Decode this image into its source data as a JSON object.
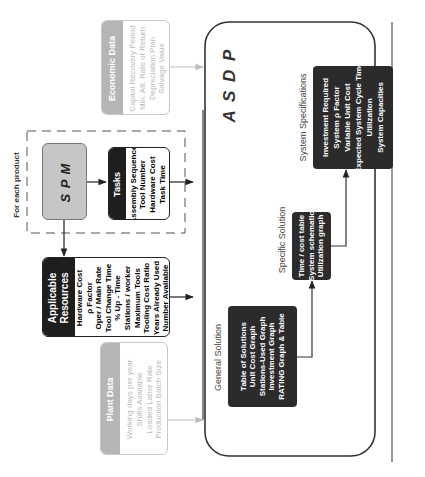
{
  "diagram": {
    "colors": {
      "dark_box": "#2b2b2b",
      "gray_header": "#b5b5b5",
      "spm_fill": "#c6c6c6",
      "line": "#333333",
      "faded_line": "#bdbdbd"
    },
    "economic_data": {
      "header": "Economic Data",
      "items": [
        "Capital Recovery Period",
        "Min. Att. Rate of Return",
        "Depreciation Plan",
        "Salvage Value"
      ]
    },
    "product_group": {
      "label": "For each product",
      "spm": {
        "label": "S P M"
      },
      "tasks": {
        "header": "Tasks",
        "items": [
          "Assembly Sequence",
          "Tool Number",
          "Hardware Cost",
          "Task Time"
        ]
      }
    },
    "applicable_resources": {
      "header_line1": "Applicable",
      "header_line2": "Resources",
      "items": [
        "Hardware Cost",
        "ρ Factor",
        "Oper / Main Rate",
        "Tool Change Time",
        "% Up - Time",
        "Stations / worker",
        "Maximum Tools",
        "Tooling Cost Ratio",
        "Years Already Used",
        "Number Available"
      ]
    },
    "plant_data": {
      "header": "Plant Data",
      "items": [
        "Working days per year",
        "Shifts Available",
        "Loaded Labor Rate",
        "Production Batch Size"
      ]
    },
    "asdp": {
      "label": "A S D P",
      "general_solution": {
        "title": "General  Solution",
        "items": [
          "Table of Solutions",
          "Unit Cost Graph",
          "Stations-Used Graph",
          "Investment Graph",
          "RATING Graph & Table"
        ]
      },
      "specific_solution": {
        "title": "Specific  Solution",
        "items": [
          "Time / cost table",
          "System schematic",
          "Utilization graph"
        ]
      },
      "system_specifications": {
        "title": "System Specifications",
        "items": [
          "Investment Required",
          "System ρ Factor",
          "Variable Unit Cost",
          "Expected System Cycle Time",
          "Utilization",
          "System Capacities"
        ]
      }
    }
  }
}
